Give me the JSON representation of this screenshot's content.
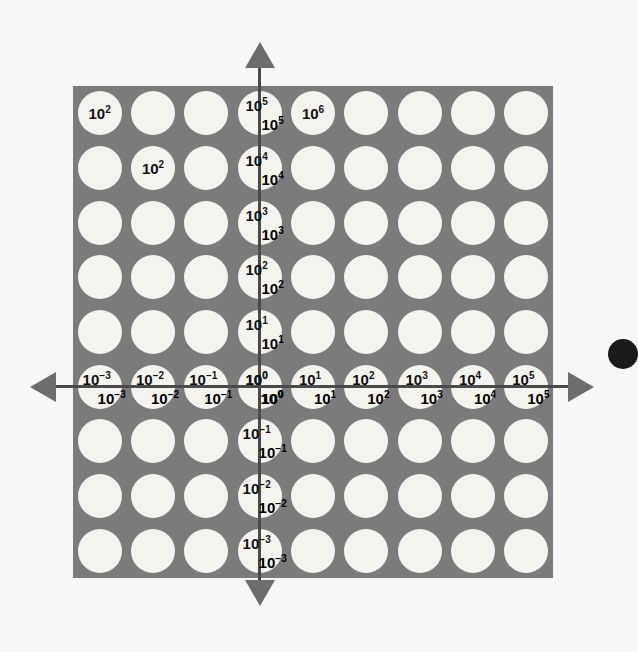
{
  "figure": {
    "kind": "log-log-coordinate-grid",
    "background_color": "#f7f7f5",
    "panel_color": "#7b7b7b",
    "circle_color": "#f4f4ef",
    "axis_color": "#4a4a4a",
    "arrow_color": "#6d6d6d",
    "label_color": "#111111"
  },
  "chart_data": {
    "type": "scatter",
    "title": "",
    "xlabel": "",
    "ylabel": "",
    "grid": true,
    "legend": "none",
    "x_scale": "log",
    "y_scale": "log",
    "columns": 9,
    "rows": 9,
    "x_tick_labels": [
      "10⁻³",
      "10⁻²",
      "10⁻¹",
      "10⁰",
      "10¹",
      "10²",
      "10³",
      "10⁴",
      "10⁵"
    ],
    "y_tick_labels": [
      "10⁵",
      "10⁴",
      "10³",
      "10²",
      "10¹",
      "10⁰",
      "10⁻¹",
      "10⁻²",
      "10⁻³"
    ],
    "x_exponents": [
      -3,
      -2,
      -1,
      0,
      1,
      2,
      3,
      4,
      5
    ],
    "y_exponents": [
      5,
      4,
      3,
      2,
      1,
      0,
      -1,
      -2,
      -3
    ],
    "xlim": [
      "1e-3",
      "1e5"
    ],
    "ylim": [
      "1e-3",
      "1e5"
    ],
    "annotations": [
      {
        "text": "10²",
        "base": "10",
        "exp": "2",
        "row": 0,
        "col": 0
      },
      {
        "text": "10⁶",
        "base": "10",
        "exp": "6",
        "row": 0,
        "col": 4
      },
      {
        "text": "10²",
        "base": "10",
        "exp": "2",
        "row": 1,
        "col": 1
      }
    ]
  },
  "axes": {
    "x_axis_name": "horizontal-axis",
    "y_axis_name": "vertical-axis",
    "arrows": [
      "left",
      "right",
      "up",
      "down"
    ]
  },
  "ticks": {
    "x": [
      {
        "base": "10",
        "exp": "−3",
        "col": 0
      },
      {
        "base": "10",
        "exp": "−2",
        "col": 1
      },
      {
        "base": "10",
        "exp": "−1",
        "col": 2
      },
      {
        "base": "10",
        "exp": "0",
        "col": 3
      },
      {
        "base": "10",
        "exp": "1",
        "col": 4
      },
      {
        "base": "10",
        "exp": "2",
        "col": 5
      },
      {
        "base": "10",
        "exp": "3",
        "col": 6
      },
      {
        "base": "10",
        "exp": "4",
        "col": 7
      },
      {
        "base": "10",
        "exp": "5",
        "col": 8
      }
    ],
    "y": [
      {
        "base": "10",
        "exp": "5",
        "row": 0
      },
      {
        "base": "10",
        "exp": "4",
        "row": 1
      },
      {
        "base": "10",
        "exp": "3",
        "row": 2
      },
      {
        "base": "10",
        "exp": "2",
        "row": 3
      },
      {
        "base": "10",
        "exp": "1",
        "row": 4
      },
      {
        "base": "10",
        "exp": "0",
        "row": 5
      },
      {
        "base": "10",
        "exp": "−1",
        "row": 6
      },
      {
        "base": "10",
        "exp": "−2",
        "row": 7
      },
      {
        "base": "10",
        "exp": "−3",
        "row": 8
      }
    ]
  },
  "geometry": {
    "panel_left": 73,
    "panel_top": 86,
    "panel_width": 480,
    "panel_height": 492,
    "col_x": [
      132,
      188,
      244,
      277,
      311,
      367,
      423,
      479,
      524
    ],
    "row_y": [
      133,
      187,
      241,
      279,
      322,
      378,
      432,
      486,
      532
    ],
    "origin_col": 3,
    "origin_row": 5,
    "cell_radius": 22
  }
}
